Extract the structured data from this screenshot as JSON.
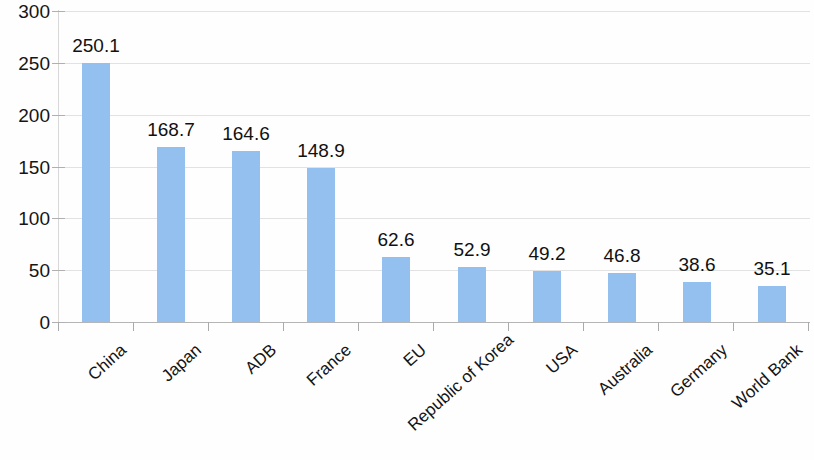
{
  "chart_data": {
    "type": "bar",
    "title": "",
    "subtitle": "",
    "xlabel": "",
    "ylabel": "",
    "categories": [
      "China",
      "Japan",
      "ADB",
      "France",
      "EU",
      "Republic of Korea",
      "USA",
      "Australia",
      "Germany",
      "World Bank"
    ],
    "values": [
      250.1,
      168.7,
      164.6,
      148.9,
      62.6,
      52.9,
      49.2,
      46.8,
      38.6,
      35.1
    ],
    "value_labels": [
      "250.1",
      "168.7",
      "164.6",
      "148.9",
      "62.6",
      "52.9",
      "49.2",
      "46.8",
      "38.6",
      "35.1"
    ],
    "series": [
      {
        "name": "",
        "values": [
          250.1,
          168.7,
          164.6,
          148.9,
          62.6,
          52.9,
          49.2,
          46.8,
          38.6,
          35.1
        ]
      }
    ],
    "ylim": [
      0,
      300
    ],
    "ytick_labels": [
      "300",
      "250",
      "200",
      "150",
      "100",
      "50",
      "0"
    ],
    "ytick_values": [
      300,
      250,
      200,
      150,
      100,
      50,
      0
    ],
    "grid": true,
    "grid_axis": "y",
    "legend": false,
    "legend_position": "none",
    "bar_color": "#93c0ef",
    "gridline_color": "#e2e2e2",
    "axis_color": "#b5b5b5",
    "text_color": "#141414",
    "background_color": "#fefefe",
    "x_tick_label_rotation": -42,
    "data_labels_shown": true
  }
}
